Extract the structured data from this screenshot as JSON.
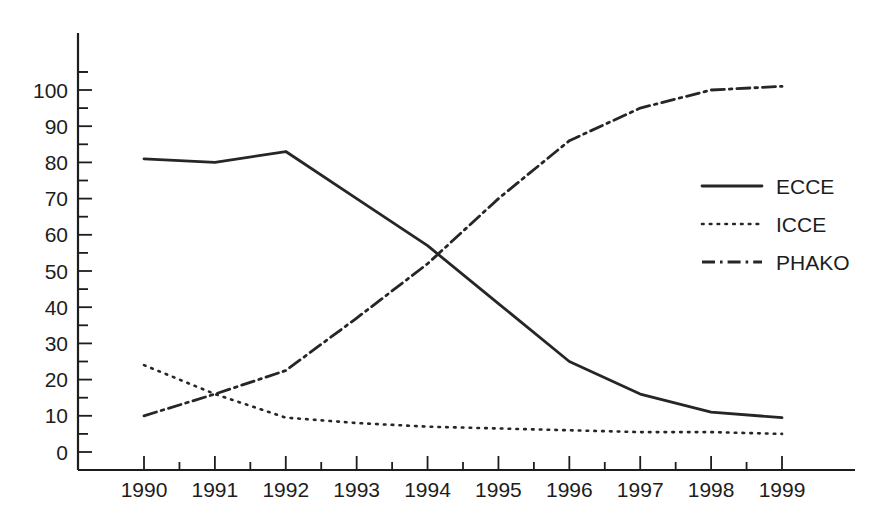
{
  "chart_data": {
    "type": "line",
    "title": "",
    "subtitle": "",
    "xlabel": "",
    "ylabel": "",
    "x": [
      1990,
      1991,
      1992,
      1993,
      1994,
      1995,
      1996,
      1997,
      1998,
      1999
    ],
    "categories": [
      "1990",
      "1991",
      "1992",
      "1993",
      "1994",
      "1995",
      "1996",
      "1997",
      "1998",
      "1999"
    ],
    "xlim": [
      1990,
      1999
    ],
    "ylim": [
      0,
      110
    ],
    "yticks": [
      0,
      10,
      20,
      30,
      40,
      50,
      60,
      70,
      80,
      90,
      100
    ],
    "ytick_labels": [
      "0",
      "10",
      "20",
      "30",
      "40",
      "50",
      "60",
      "70",
      "80",
      "90",
      "100"
    ],
    "yminor_step": 5,
    "grid": false,
    "legend_position": "right",
    "series": [
      {
        "name": "ECCE",
        "style": "solid",
        "color": "#262626",
        "values": [
          81,
          80,
          83,
          70,
          57,
          41,
          25,
          16,
          11,
          9.5
        ]
      },
      {
        "name": "ICCE",
        "style": "dotted",
        "color": "#262626",
        "values": [
          24,
          16,
          9.5,
          8,
          7,
          6.5,
          6,
          5.5,
          5.5,
          5
        ]
      },
      {
        "name": "PHAKO",
        "style": "dashdot",
        "color": "#262626",
        "values": [
          10,
          16,
          22.5,
          37,
          52,
          70,
          86,
          95,
          100,
          101
        ]
      }
    ]
  },
  "legend": {
    "items": [
      {
        "label": "ECCE",
        "style": "solid"
      },
      {
        "label": "ICCE",
        "style": "dotted"
      },
      {
        "label": "PHAKO",
        "style": "dashdot"
      }
    ]
  }
}
